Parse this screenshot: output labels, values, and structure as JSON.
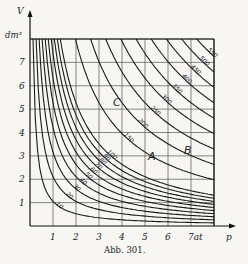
{
  "chart_data": {
    "type": "line",
    "title": "",
    "caption": "Abb. 301.",
    "xlabel": "p",
    "ylabel": "V",
    "x_unit": "at",
    "y_unit": "dm³",
    "xlim": [
      0,
      8
    ],
    "ylim": [
      0,
      8
    ],
    "grid": true,
    "x_ticks": [
      "1",
      "2",
      "3",
      "4",
      "5",
      "6",
      "7at"
    ],
    "y_ticks": [
      "1",
      "2",
      "3",
      "4",
      "5",
      "6",
      "7"
    ],
    "curve_family": "p·V = const (isotherms / hyperbolas)",
    "series": [
      {
        "name": "10",
        "const": 10
      },
      {
        "name": "20",
        "const": 20
      },
      {
        "name": "30",
        "const": 30
      },
      {
        "name": "40",
        "const": 40
      },
      {
        "name": "50",
        "const": 50
      },
      {
        "name": "60",
        "const": 60
      },
      {
        "name": "70",
        "const": 70
      },
      {
        "name": "80",
        "const": 80
      },
      {
        "name": "90",
        "const": 90
      },
      {
        "name": "100",
        "const": 100
      },
      {
        "name": "150",
        "const": 150
      },
      {
        "name": "200",
        "const": 200
      },
      {
        "name": "250",
        "const": 250
      },
      {
        "name": "300",
        "const": 300
      },
      {
        "name": "350",
        "const": 350
      },
      {
        "name": "400",
        "const": 400
      },
      {
        "name": "450",
        "const": 450
      },
      {
        "name": "500",
        "const": 500
      },
      {
        "name": "550",
        "const": 550
      }
    ],
    "annotations": [
      {
        "text": "A",
        "x": 4.9,
        "y": 3.2
      },
      {
        "text": "B",
        "x": 6.6,
        "y": 3.7
      },
      {
        "text": "C",
        "x": 3.6,
        "y": 5.2
      }
    ]
  },
  "labels": {
    "y_axis": "V",
    "y_unit": "dm³",
    "x_axis": "p",
    "caption": "Abb. 301.",
    "A": "A",
    "B": "B",
    "C": "C"
  }
}
